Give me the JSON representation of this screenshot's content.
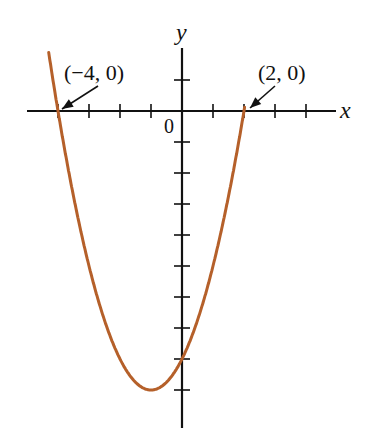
{
  "chart_data": {
    "type": "line",
    "title": "",
    "function": "y = x^2 + 2x - 8",
    "xlabel": "x",
    "ylabel": "y",
    "origin_label": "0",
    "xlim": [
      -5,
      5
    ],
    "ylim": [
      -10,
      2
    ],
    "x_ticks": [
      -4,
      -3,
      -2,
      -1,
      1,
      2,
      3,
      4
    ],
    "y_ticks": [
      1,
      -1,
      -2,
      -3,
      -4,
      -5,
      -6,
      -7,
      -8,
      -9
    ],
    "grid": false,
    "curve_color": "#b5602a",
    "series": [
      {
        "name": "parabola",
        "x": [
          -4.3,
          -4,
          -3,
          -2,
          -1,
          0,
          1,
          2,
          2.03
        ],
        "y": [
          1.29,
          0,
          -5,
          -8,
          -9,
          -8,
          -5,
          0,
          0.18
        ]
      }
    ],
    "annotations": [
      {
        "text": "(−4, 0)",
        "point": [
          -4,
          0
        ]
      },
      {
        "text": "(2, 0)",
        "point": [
          2,
          0
        ]
      }
    ],
    "vertex": [
      -1,
      -9
    ],
    "y_intercept": -8
  }
}
